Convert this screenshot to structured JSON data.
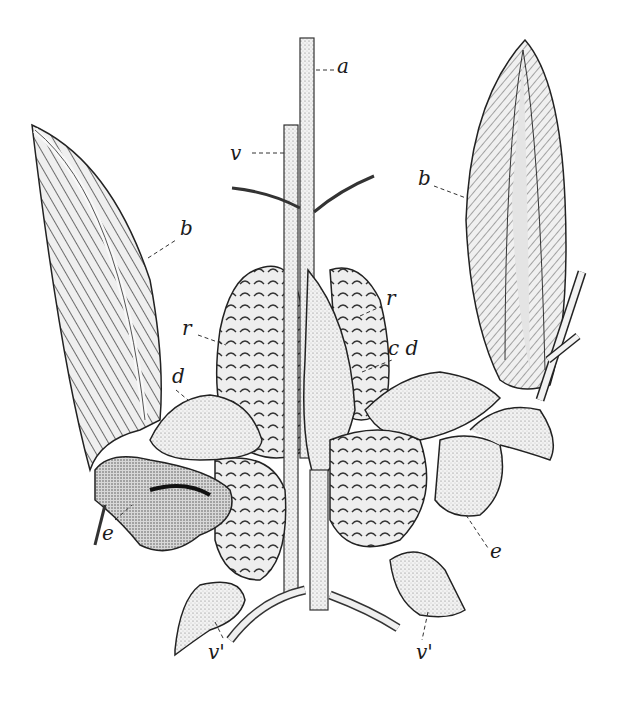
{
  "figure": {
    "type": "anatomical-engraving",
    "colors": {
      "ink": "#1a1a1a",
      "paper": "#ffffff",
      "shade": "#9a9a9a",
      "light": "#e6e6e6"
    },
    "labels": [
      {
        "id": "a",
        "text": "a",
        "x": 337,
        "y": 66
      },
      {
        "id": "v",
        "text": "v",
        "x": 230,
        "y": 160
      },
      {
        "id": "b-left",
        "text": "b",
        "x": 180,
        "y": 230
      },
      {
        "id": "b-right",
        "text": "b",
        "x": 418,
        "y": 180
      },
      {
        "id": "r-left",
        "text": "r",
        "x": 182,
        "y": 330
      },
      {
        "id": "r-right",
        "text": "r",
        "x": 386,
        "y": 300
      },
      {
        "id": "cd",
        "text": "c d",
        "x": 388,
        "y": 350
      },
      {
        "id": "d-left",
        "text": "d",
        "x": 172,
        "y": 378
      },
      {
        "id": "e-left",
        "text": "e",
        "x": 102,
        "y": 535
      },
      {
        "id": "e-right",
        "text": "e",
        "x": 490,
        "y": 553
      },
      {
        "id": "v-prime-left",
        "text": "v'",
        "x": 208,
        "y": 654
      },
      {
        "id": "v-prime-right",
        "text": "v'",
        "x": 416,
        "y": 654
      }
    ]
  }
}
